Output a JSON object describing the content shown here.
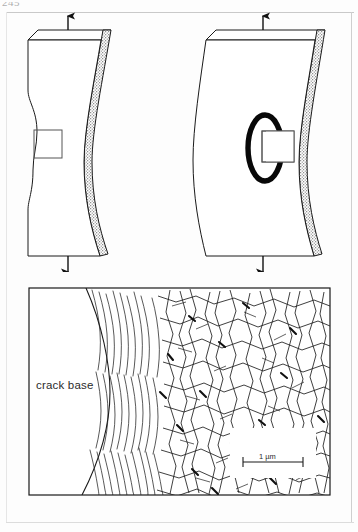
{
  "figure": {
    "domain_kind": "diagram",
    "page_header": {
      "folio_text": "245",
      "note": "partially cropped page number at top-left"
    },
    "panels": [
      {
        "id": "panel-specimens",
        "kind": "schematic-3d",
        "description": "Two hourglass (waisted) tensile test specimens drawn in oblique 3D projection, each loaded in uniaxial tension",
        "specimens": [
          {
            "id": "specimen-left",
            "label": "",
            "waist_profile": "strongly necked, deep concave waist on left face",
            "side_face_fill": "stippled",
            "inset_rectangle": {
              "present": true,
              "style": "thin outline",
              "meaning": "region of interest"
            },
            "ring_marker": {
              "present": false
            },
            "arrows": [
              {
                "name": "tension-arrow-top",
                "direction": "up"
              },
              {
                "name": "tension-arrow-bottom",
                "direction": "down"
              }
            ]
          },
          {
            "id": "specimen-right",
            "label": "",
            "waist_profile": "shallow concave waist, broader gauge section",
            "side_face_fill": "stippled",
            "inset_rectangle": {
              "present": true,
              "style": "thin outline",
              "meaning": "region of interest"
            },
            "ring_marker": {
              "present": true,
              "style": "bold black ellipse annulus",
              "meaning": "circumferential crack / notch"
            },
            "arrows": [
              {
                "name": "tension-arrow-top",
                "direction": "up"
              },
              {
                "name": "tension-arrow-bottom",
                "direction": "down"
              }
            ]
          }
        ]
      },
      {
        "id": "panel-micrograph",
        "kind": "schematic-micrograph",
        "description": "Traced micrograph of fracture/crack region showing a smooth crack base at left, a band of elongated fibrous striations, and an equiaxed polygonal crack-network microstructure filling the right",
        "labels": [
          {
            "name": "crack-base-label",
            "text": "crack base"
          }
        ],
        "zones": [
          {
            "name": "crack-base-zone",
            "text": "crack base",
            "appearance": "blank / featureless",
            "position": "left"
          },
          {
            "name": "fibrous-striation-zone",
            "appearance": "dense vertical elongated striations",
            "position": "center-left band"
          },
          {
            "name": "equiaxed-network-zone",
            "appearance": "polygonal equiaxed crack network",
            "position": "center to right"
          }
        ],
        "scale_bar": {
          "name": "scale-bar",
          "label": "1 µm",
          "length_value": 1,
          "length_unit": "µm",
          "position": "lower right, on white inset patch"
        }
      }
    ],
    "colors": {
      "ink": "#1a1a1a",
      "stipple_gray": "#b9b9b9",
      "paper": "#fdfdfd",
      "frame_gray": "#cfcfcf"
    }
  }
}
